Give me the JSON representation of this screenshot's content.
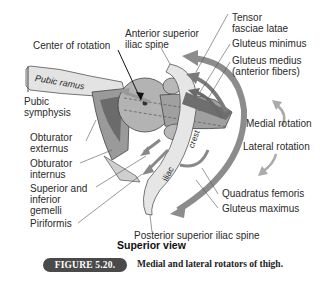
{
  "labels": {
    "center_of_rotation": "Center of rotation",
    "anterior_superior_iliac_spine": [
      "Anterior superior",
      "iliac spine"
    ],
    "tensor_fasciae_latae": [
      "Tensor",
      "fasciae latae"
    ],
    "gluteus_minimus": "Gluteus minimus",
    "gluteus_medius": [
      "Gluteus medius",
      "(anterior fibers)"
    ],
    "medial_rotation": "Medial rotation",
    "lateral_rotation": "Lateral rotation",
    "pubic_ramus": "Pubic ramus",
    "pubic_symphysis": [
      "Pubic",
      "symphysis"
    ],
    "obturator_externus": [
      "Obturator",
      "externus"
    ],
    "obturator_internus": [
      "Obturator",
      "internus"
    ],
    "superior_inferior_gemelli": [
      "Superior and",
      "inferior",
      "gemelli"
    ],
    "piriformis": "Piriformis",
    "iliac_crest": [
      "iliac",
      "crest"
    ],
    "quadratus_femoris": "Quadratus femoris",
    "gluteus_maximus": "Gluteus maximus",
    "posterior_superior_iliac_spine": "Posterior superior iliac spine",
    "superior_view": "Superior view"
  },
  "figure": {
    "number": "FIGURE 5.20.",
    "caption": "Medial and lateral rotators of thigh."
  },
  "colors": {
    "bone": "#d9d9d9",
    "femur_head": "#a9a9a9",
    "muscle_dark": "#5a5a5a",
    "arrow_gray": "#8c8c8c",
    "badge": "#4a4a4a"
  }
}
